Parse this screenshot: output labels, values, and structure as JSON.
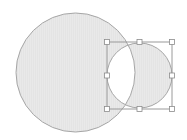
{
  "canvas": {
    "width": 187,
    "height": 140,
    "background": "#ffffff"
  },
  "shapes": {
    "fill_color": "#e4e4e4",
    "stroke_color": "#a6a6a6",
    "fill_rule": "xor",
    "large_circle": {
      "cx": 75.5,
      "cy": 72.5,
      "r": 59.5
    },
    "small_circle": {
      "cx": 139.5,
      "cy": 75.5,
      "r": 32.5,
      "selected": true
    }
  },
  "selection": {
    "box": {
      "x": 107,
      "y": 42,
      "width": 65,
      "height": 67
    },
    "stroke_color": "#9a9a9a",
    "handle_fill": "#ffffff",
    "handle_stroke": "#8c8c8c",
    "handle_size": 5,
    "handles": [
      {
        "name": "handle-top-left",
        "x": 107,
        "y": 42
      },
      {
        "name": "handle-top-middle",
        "x": 139.5,
        "y": 42
      },
      {
        "name": "handle-top-right",
        "x": 172,
        "y": 42
      },
      {
        "name": "handle-middle-left",
        "x": 107,
        "y": 75.5
      },
      {
        "name": "handle-middle-right",
        "x": 172,
        "y": 75.5
      },
      {
        "name": "handle-bottom-left",
        "x": 107,
        "y": 109
      },
      {
        "name": "handle-bottom-middle",
        "x": 139.5,
        "y": 109
      },
      {
        "name": "handle-bottom-right",
        "x": 172,
        "y": 109
      }
    ]
  }
}
